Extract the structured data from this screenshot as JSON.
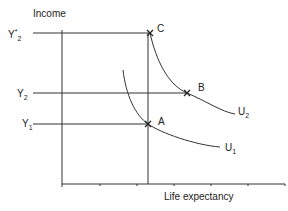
{
  "diagram": {
    "y_axis_label": "Income",
    "x_axis_label": "Life expectancy",
    "y_levels": [
      {
        "id": "Y_star_2",
        "base": "Y",
        "sup": "*",
        "sub": "2",
        "y": 33
      },
      {
        "id": "Y_2",
        "base": "Y",
        "sup": "",
        "sub": "2",
        "y": 93
      },
      {
        "id": "Y_1",
        "base": "Y",
        "sup": "",
        "sub": "1",
        "y": 124
      }
    ],
    "points": [
      {
        "label": "C",
        "x": 150,
        "y": 33
      },
      {
        "label": "B",
        "x": 187,
        "y": 93
      },
      {
        "label": "A",
        "x": 148,
        "y": 124
      }
    ],
    "curves": [
      {
        "label": "U",
        "sub": "2",
        "path": "M150,33 C156,60 168,85 187,93 S222,112 235,114"
      },
      {
        "label": "U",
        "sub": "1",
        "path": "M123,70 C126,95 135,115 148,124 S195,145 220,147"
      }
    ],
    "colors": {
      "line": "#333333",
      "text": "#222222"
    }
  }
}
